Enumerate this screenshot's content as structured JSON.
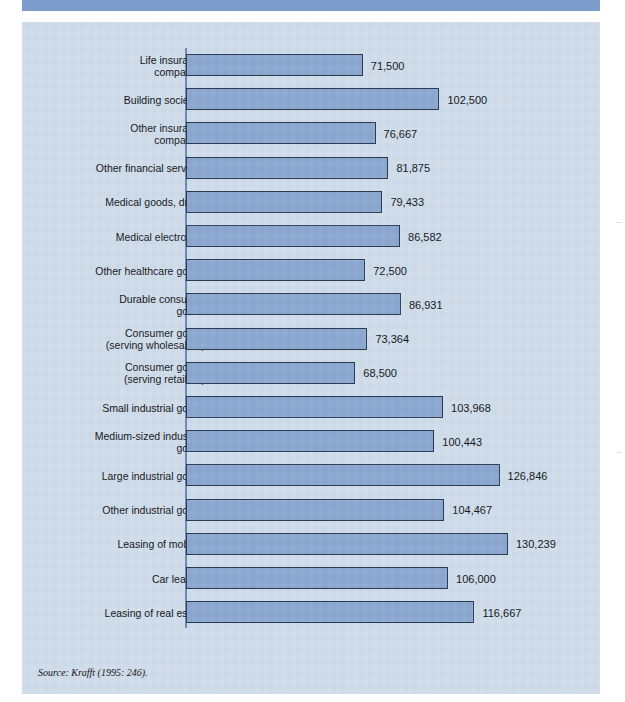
{
  "header": {
    "strip_text": ""
  },
  "source_note": "Source: Krafft (1995: 246).",
  "colors": {
    "panel_background": "#cfdcea",
    "bar_fill": "#8ba8d0",
    "bar_border": "#2b3a52",
    "header_strip": "#7e9ccb",
    "axis": "#6a86b4",
    "text": "#14161a"
  },
  "chart_data": {
    "type": "bar",
    "orientation": "horizontal",
    "title": "",
    "subtitle": "",
    "xlabel": "",
    "ylabel": "",
    "grid": false,
    "legend": "none",
    "xlim": [
      0,
      130239
    ],
    "categories": [
      "Life insurance\ncompanies",
      "Building societies",
      "Other insurance\ncompanies",
      "Other financial services",
      "Medical goods, drugs",
      "Medical electronics",
      "Other healthcare goods",
      "Durable consumer\ngoods",
      "Consumer goods\n(serving wholesalers)",
      "Consumer goods\n(serving retailers)",
      "Small industrial goods",
      "Medium-sized industrial\ngoods",
      "Large industrial goods",
      "Other industrial goods",
      "Leasing of mobiles",
      "Car leasing",
      "Leasing of real estate"
    ],
    "values": [
      71500,
      102500,
      76667,
      81875,
      79433,
      86582,
      72500,
      86931,
      73364,
      68500,
      103968,
      100443,
      126846,
      104467,
      130239,
      106000,
      116667
    ],
    "value_labels": [
      "71,500",
      "102,500",
      "76,667",
      "81,875",
      "79,433",
      "86,582",
      "72,500",
      "86,931",
      "73,364",
      "68,500",
      "103,968",
      "100,443",
      "126,846",
      "104,467",
      "130,239",
      "106,000",
      "116,667"
    ]
  }
}
